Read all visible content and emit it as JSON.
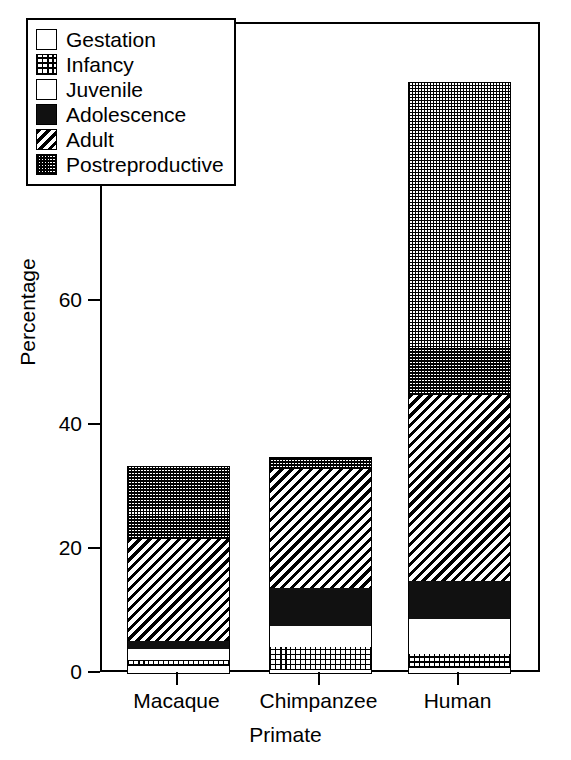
{
  "chart_data": {
    "type": "bar",
    "subtype": "stacked-bar",
    "title": "",
    "xlabel": "Primate",
    "ylabel": "Percentage",
    "categories": [
      "Macaque",
      "Chimpanzee",
      "Human"
    ],
    "ylim": [
      0,
      100
    ],
    "yticks": [
      0,
      20,
      40,
      60,
      80,
      100
    ],
    "ytick_labels": [
      "0",
      "20",
      "40",
      "60",
      "80",
      "100"
    ],
    "grid": false,
    "legend_position": "upper-left-inside",
    "series": [
      {
        "name": "Gestation",
        "pattern": "checkerboard",
        "values": [
          1.3,
          0.6,
          1.0
        ]
      },
      {
        "name": "Infancy",
        "pattern": "fine-grid",
        "values": [
          1.0,
          3.7,
          2.2
        ]
      },
      {
        "name": "Juvenile",
        "pattern": "solid-white",
        "values": [
          1.8,
          3.4,
          5.7
        ]
      },
      {
        "name": "Adolescence",
        "pattern": "solid-black",
        "values": [
          1.3,
          6.1,
          6.1
        ]
      },
      {
        "name": "Adult",
        "pattern": "diagonal-hatch",
        "values": [
          16.3,
          19.2,
          30.0
        ]
      },
      {
        "name": "Postreproductive",
        "pattern": "gray-stipple",
        "values": [
          11.9,
          2.0,
          50.5
        ]
      }
    ],
    "totals": [
      33.6,
      35.0,
      95.5
    ]
  },
  "axis": {
    "y_title": "Percentage",
    "x_title": "Primate"
  },
  "legend": {
    "items": [
      {
        "label": "Gestation"
      },
      {
        "label": "Infancy"
      },
      {
        "label": "Juvenile"
      },
      {
        "label": "Adolescence"
      },
      {
        "label": "Adult"
      },
      {
        "label": "Postreproductive"
      }
    ]
  },
  "colors": {
    "foreground": "#000000",
    "background": "#ffffff",
    "adolescence_fill": "#111111",
    "postreproductive_tone": "#808080"
  }
}
